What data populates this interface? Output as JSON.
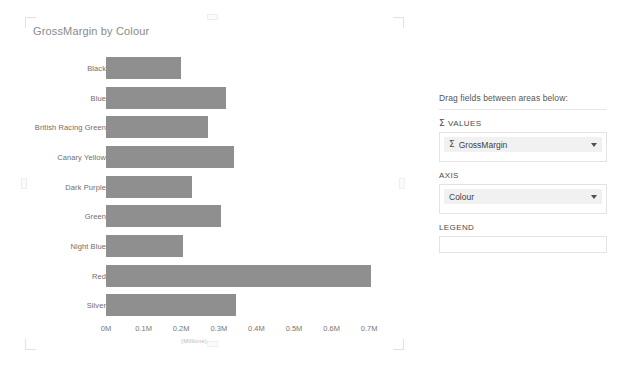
{
  "chart": {
    "title": "GrossMargin by Colour",
    "axis_units_label": "(Millions)"
  },
  "chart_data": {
    "type": "bar",
    "orientation": "horizontal",
    "title": "GrossMargin by Colour",
    "xlabel": "(Millions)",
    "ylabel": "",
    "categories": [
      "Black",
      "Blue",
      "British Racing Green",
      "Canary Yellow",
      "Dark Purple",
      "Green",
      "Night Blue",
      "Red",
      "Silver"
    ],
    "values": [
      0.2,
      0.32,
      0.27,
      0.34,
      0.23,
      0.305,
      0.205,
      0.705,
      0.345
    ],
    "value_unit": "M",
    "xlim": [
      0,
      0.75
    ],
    "tick_labels": [
      "0M",
      "0.1M",
      "0.2M",
      "0.3M",
      "0.4M",
      "0.5M",
      "0.6M",
      "0.7M"
    ],
    "tick_values": [
      0,
      0.1,
      0.2,
      0.3,
      0.4,
      0.5,
      0.6,
      0.7
    ],
    "grid": false,
    "legend": null,
    "bar_color": "#8f8f8f",
    "series": [
      {
        "name": "GrossMargin",
        "values": [
          0.2,
          0.32,
          0.27,
          0.34,
          0.23,
          0.305,
          0.205,
          0.705,
          0.345
        ]
      }
    ]
  },
  "fields_pane": {
    "header": "Drag fields between areas below:",
    "wells": [
      {
        "name": "values",
        "title": "VALUES",
        "has_sigma": true,
        "sigma_glyph": "Σ",
        "chips": [
          {
            "label": "GrossMargin",
            "has_sigma": true,
            "sigma_glyph": "Σ"
          }
        ]
      },
      {
        "name": "axis",
        "title": "AXIS",
        "has_sigma": false,
        "chips": [
          {
            "label": "Colour",
            "has_sigma": false
          }
        ]
      },
      {
        "name": "legend",
        "title": "LEGEND",
        "has_sigma": false,
        "chips": []
      }
    ]
  },
  "colors": {
    "bar": "#8f8f8f",
    "title_text": "#8a8a8a",
    "label_text": "#6e6e6e",
    "chip_bg": "#f1f1f1",
    "border": "#e3e3e3"
  }
}
